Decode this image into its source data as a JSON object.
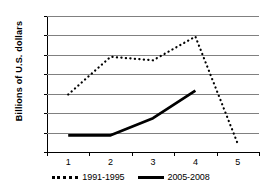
{
  "chart_data": {
    "type": "line",
    "title": "",
    "xlabel": "",
    "ylabel": "Billions of  U.S. dollars",
    "categories": [
      "1",
      "2",
      "3",
      "4",
      "5"
    ],
    "ylim": [
      0,
      35
    ],
    "ytick_step": 5,
    "yticks": [
      "0",
      "5",
      "10",
      "15",
      "20",
      "25",
      "30",
      "35"
    ],
    "grid": true,
    "legend_position": "bottom",
    "series": [
      {
        "name": "1991-1995",
        "style": "dotted",
        "color": "#000000",
        "values": [
          14.8,
          24.5,
          23.6,
          29.7,
          2.1
        ]
      },
      {
        "name": "2005-2008",
        "style": "solid",
        "color": "#000000",
        "values": [
          4.3,
          4.3,
          8.7,
          15.8,
          null
        ]
      }
    ]
  },
  "legend": {
    "entries": [
      {
        "label": "1991-1995"
      },
      {
        "label": "2005-2008"
      }
    ]
  }
}
